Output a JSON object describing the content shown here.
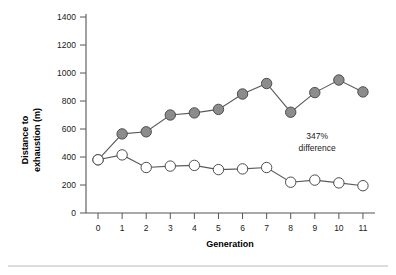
{
  "chart_data": {
    "type": "line",
    "title": "",
    "xlabel": "Generation",
    "ylabel": "Distance to exhaustion (m)",
    "ylabel_line1": "Distance to",
    "ylabel_line2": "exhaustion (m)",
    "x": [
      0,
      1,
      2,
      3,
      4,
      5,
      6,
      7,
      8,
      9,
      10,
      11
    ],
    "xtick_labels": [
      "0",
      "1",
      "2",
      "3",
      "4",
      "5",
      "6",
      "7",
      "8",
      "9",
      "10",
      "11"
    ],
    "ytick_labels": [
      "0",
      "200",
      "400",
      "600",
      "800",
      "1000",
      "1200",
      "1400"
    ],
    "yticks": [
      0,
      200,
      400,
      600,
      800,
      1000,
      1200,
      1400
    ],
    "ylim": [
      0,
      1400
    ],
    "xlim": [
      -0.5,
      11.5
    ],
    "grid": false,
    "legend": "none",
    "series": [
      {
        "name": "selected",
        "marker": "filled-circle",
        "marker_color": "#8c8c8c",
        "marker_edge_color": "#4d4d4d",
        "line_color": "#5a5a5a",
        "values": [
          380,
          565,
          580,
          700,
          715,
          740,
          850,
          925,
          720,
          860,
          950,
          865
        ]
      },
      {
        "name": "control",
        "marker": "open-circle",
        "marker_color": "#ffffff",
        "marker_edge_color": "#4d4d4d",
        "line_color": "#5a5a5a",
        "values": [
          380,
          415,
          325,
          335,
          340,
          310,
          315,
          325,
          220,
          235,
          215,
          195
        ]
      }
    ],
    "annotations": [
      {
        "line1": "347%",
        "line2": "difference",
        "x": 9.1,
        "y": 530
      }
    ]
  },
  "figure": {
    "background": "#ffffff",
    "axis_color": "#555555",
    "text_color": "#1a1a1a",
    "rule_color": "#b9b9b9"
  }
}
